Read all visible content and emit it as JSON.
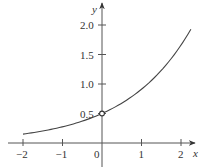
{
  "chart_data": {
    "type": "line",
    "title": "",
    "xlabel": "x",
    "ylabel": "y",
    "xlim": [
      -2.35,
      2.35
    ],
    "ylim": [
      -0.4,
      2.35
    ],
    "grid": false,
    "legend": null,
    "x_ticks": [
      -2,
      -1,
      0,
      1,
      2
    ],
    "x_tick_labels": [
      "−2",
      "−1",
      "0",
      "1",
      "2"
    ],
    "y_ticks": [
      0.5,
      1.0,
      1.5,
      2.0
    ],
    "y_tick_labels": [
      "0.5",
      "1.0",
      "1.5",
      "2.0"
    ],
    "series": [
      {
        "name": "curve",
        "function": "y = 0.5 e^{0.6x}",
        "x": [
          -2.0,
          -1.5,
          -1.0,
          -0.5,
          0.0,
          0.5,
          1.0,
          1.5,
          2.0,
          2.25
        ],
        "values": [
          0.15,
          0.2,
          0.27,
          0.37,
          0.5,
          0.67,
          0.91,
          1.23,
          1.66,
          1.93
        ],
        "color": "#444444"
      }
    ],
    "annotations": [
      {
        "type": "open-circle",
        "x": 0,
        "y": 0.5
      }
    ]
  },
  "colors": {
    "axis": "#555555",
    "curve": "#444444",
    "background": "#ffffff"
  }
}
